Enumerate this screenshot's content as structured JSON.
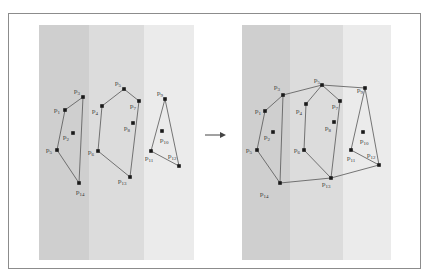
{
  "figure": {
    "stripe_colors": [
      "#cfcfcf",
      "#dcdcdc",
      "#ebebeb"
    ],
    "line_color": "#555555",
    "point_color": "#1a1a1a",
    "arrow": "→"
  },
  "left_panel": {
    "hulls": [
      {
        "name": "hull-1",
        "points": [
          [
            "p3",
            83,
            97
          ],
          [
            "p1",
            65,
            110
          ],
          [
            "p5",
            57,
            150
          ],
          [
            "p14",
            79,
            183
          ]
        ],
        "closed": true,
        "polyline": [
          [
            "p3",
            83,
            97
          ],
          [
            "p1",
            65,
            110
          ],
          [
            "p5",
            57,
            150
          ],
          [
            "p14",
            79,
            183
          ],
          [
            "p3",
            83,
            97
          ]
        ]
      },
      {
        "name": "hull-2",
        "polyline": [
          [
            "p5",
            124,
            89
          ],
          [
            "p4",
            102,
            106
          ],
          [
            "p6",
            98,
            151
          ],
          [
            "p13",
            130,
            177
          ],
          [
            "p7",
            139,
            101
          ],
          [
            "p5",
            124,
            89
          ]
        ]
      },
      {
        "name": "hull-3",
        "polyline": [
          [
            "p9",
            165,
            99
          ],
          [
            "p11",
            151,
            151
          ],
          [
            "p12",
            179,
            166
          ],
          [
            "p9",
            165,
            99
          ]
        ]
      }
    ],
    "points": [
      {
        "label": "p",
        "sub": "3",
        "x": 83,
        "y": 97,
        "lx": 74,
        "ly": 93
      },
      {
        "label": "p",
        "sub": "1",
        "x": 65,
        "y": 110,
        "lx": 54,
        "ly": 112
      },
      {
        "label": "p",
        "sub": "2",
        "x": 73,
        "y": 133,
        "lx": 63,
        "ly": 139
      },
      {
        "label": "p",
        "sub": "5",
        "x": 57,
        "y": 150,
        "lx": 46,
        "ly": 152
      },
      {
        "label": "p",
        "sub": "14",
        "x": 79,
        "y": 183,
        "lx": 76,
        "ly": 194
      },
      {
        "label": "p",
        "sub": "5",
        "x": 124,
        "y": 89,
        "lx": 115,
        "ly": 85
      },
      {
        "label": "p",
        "sub": "4",
        "x": 102,
        "y": 106,
        "lx": 92,
        "ly": 113
      },
      {
        "label": "p",
        "sub": "7",
        "x": 139,
        "y": 101,
        "lx": 130,
        "ly": 108
      },
      {
        "label": "p",
        "sub": "8",
        "x": 133,
        "y": 123,
        "lx": 124,
        "ly": 130
      },
      {
        "label": "p",
        "sub": "6",
        "x": 98,
        "y": 151,
        "lx": 88,
        "ly": 154
      },
      {
        "label": "p",
        "sub": "13",
        "x": 130,
        "y": 177,
        "lx": 118,
        "ly": 183
      },
      {
        "label": "p",
        "sub": "9",
        "x": 165,
        "y": 99,
        "lx": 157,
        "ly": 95
      },
      {
        "label": "p",
        "sub": "10",
        "x": 162,
        "y": 131,
        "lx": 160,
        "ly": 142
      },
      {
        "label": "p",
        "sub": "11",
        "x": 151,
        "y": 151,
        "lx": 145,
        "ly": 160
      },
      {
        "label": "p",
        "sub": "12",
        "x": 179,
        "y": 166,
        "lx": 168,
        "ly": 158
      }
    ]
  },
  "right_panel": {
    "hull": [
      [
        "p1t",
        283,
        95
      ],
      [
        "p3",
        322,
        85
      ],
      [
        "p9",
        365,
        88
      ],
      [
        "p12",
        379,
        165
      ],
      [
        "p13",
        331,
        178
      ],
      [
        "p14",
        280,
        183
      ],
      [
        "p5",
        257,
        150
      ],
      [
        "p1",
        265,
        111
      ],
      [
        "p1t",
        283,
        95
      ]
    ],
    "inner_lines": [
      [
        [
          "p1t",
          283,
          95
        ],
        [
          "p14",
          280,
          183
        ]
      ],
      [
        [
          "p3",
          322,
          85
        ],
        [
          "p4",
          306,
          104
        ],
        [
          "p6",
          304,
          150
        ],
        [
          "p13",
          331,
          178
        ]
      ],
      [
        [
          "p3",
          322,
          85
        ],
        [
          "p7",
          340,
          101
        ],
        [
          "p13",
          331,
          178
        ]
      ],
      [
        [
          "p9",
          365,
          88
        ],
        [
          "p11",
          351,
          150
        ],
        [
          "p12",
          379,
          165
        ]
      ]
    ],
    "points": [
      {
        "label": "p",
        "sub": "3",
        "x": 283,
        "y": 95,
        "lx": 274,
        "ly": 89
      },
      {
        "label": "p",
        "sub": "1",
        "x": 265,
        "y": 111,
        "lx": 255,
        "ly": 113
      },
      {
        "label": "p",
        "sub": "2",
        "x": 273,
        "y": 132,
        "lx": 264,
        "ly": 139
      },
      {
        "label": "p",
        "sub": "5",
        "x": 257,
        "y": 150,
        "lx": 246,
        "ly": 152
      },
      {
        "label": "p",
        "sub": "14",
        "x": 280,
        "y": 183,
        "lx": 260,
        "ly": 196
      },
      {
        "label": "p",
        "sub": "5",
        "x": 322,
        "y": 85,
        "lx": 314,
        "ly": 82
      },
      {
        "label": "p",
        "sub": "4",
        "x": 306,
        "y": 104,
        "lx": 296,
        "ly": 113
      },
      {
        "label": "p",
        "sub": "7",
        "x": 340,
        "y": 101,
        "lx": 332,
        "ly": 108
      },
      {
        "label": "p",
        "sub": "8",
        "x": 334,
        "y": 122,
        "lx": 325,
        "ly": 130
      },
      {
        "label": "p",
        "sub": "6",
        "x": 304,
        "y": 150,
        "lx": 294,
        "ly": 152
      },
      {
        "label": "p",
        "sub": "13",
        "x": 331,
        "y": 178,
        "lx": 322,
        "ly": 186
      },
      {
        "label": "p",
        "sub": "9",
        "x": 365,
        "y": 88,
        "lx": 357,
        "ly": 92
      },
      {
        "label": "p",
        "sub": "10",
        "x": 363,
        "y": 132,
        "lx": 360,
        "ly": 143
      },
      {
        "label": "p",
        "sub": "11",
        "x": 351,
        "y": 150,
        "lx": 347,
        "ly": 160
      },
      {
        "label": "p",
        "sub": "12",
        "x": 379,
        "y": 165,
        "lx": 367,
        "ly": 157
      }
    ]
  }
}
